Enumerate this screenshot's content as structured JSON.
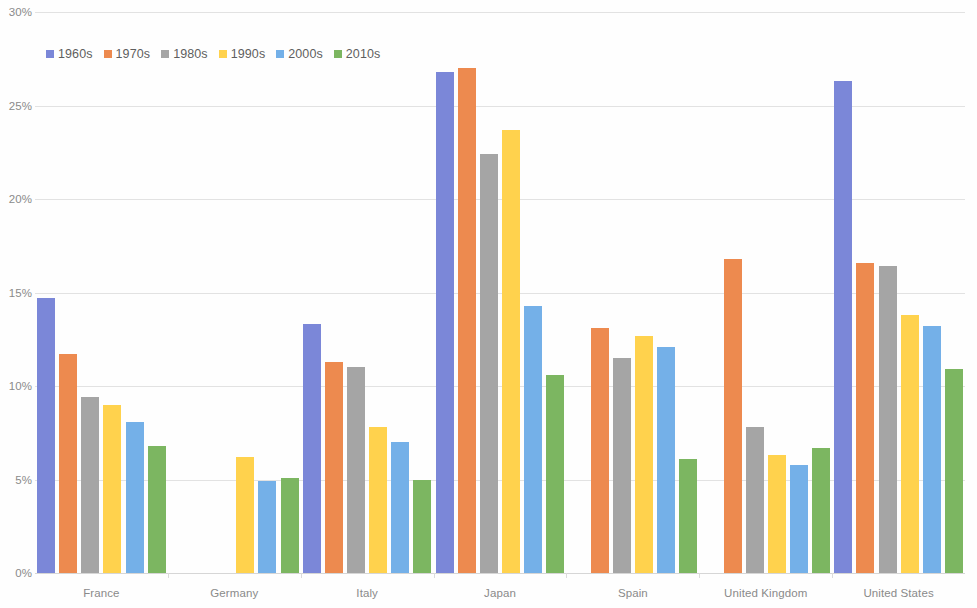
{
  "chart_data": {
    "type": "bar",
    "title": "",
    "subtitle": "",
    "xlabel": "",
    "ylabel": "",
    "ylim": [
      0,
      30
    ],
    "y_ticks": [
      0,
      5,
      10,
      15,
      20,
      25,
      30
    ],
    "y_tick_labels": [
      "0%",
      "5%",
      "10%",
      "15%",
      "20%",
      "25%",
      "30%"
    ],
    "grid": true,
    "legend_position": "top-left",
    "categories": [
      "France",
      "Germany",
      "Italy",
      "Japan",
      "Spain",
      "United Kingdom",
      "United States"
    ],
    "series": [
      {
        "name": "1960s",
        "color": "#7b87d8",
        "values": [
          14.7,
          null,
          13.3,
          26.8,
          null,
          null,
          26.3
        ]
      },
      {
        "name": "1970s",
        "color": "#ed8a4f",
        "values": [
          11.7,
          null,
          11.3,
          27.0,
          13.1,
          16.8,
          16.6
        ]
      },
      {
        "name": "1980s",
        "color": "#a5a5a5",
        "values": [
          9.4,
          null,
          11.0,
          22.4,
          11.5,
          7.8,
          16.4
        ]
      },
      {
        "name": "1990s",
        "color": "#ffd24d",
        "values": [
          9.0,
          6.2,
          7.8,
          23.7,
          12.7,
          6.3,
          13.8
        ]
      },
      {
        "name": "2000s",
        "color": "#74b0e8",
        "values": [
          8.1,
          4.9,
          7.0,
          14.3,
          12.1,
          5.8,
          13.2
        ]
      },
      {
        "name": "2010s",
        "color": "#7cb661",
        "values": [
          6.8,
          5.1,
          5.0,
          10.6,
          6.1,
          6.7,
          10.9
        ]
      }
    ]
  },
  "legend": {
    "items": [
      {
        "label": "1960s",
        "color": "#7b87d8"
      },
      {
        "label": "1970s",
        "color": "#ed8a4f"
      },
      {
        "label": "1980s",
        "color": "#a5a5a5"
      },
      {
        "label": "1990s",
        "color": "#ffd24d"
      },
      {
        "label": "2000s",
        "color": "#74b0e8"
      },
      {
        "label": "2010s",
        "color": "#7cb661"
      }
    ]
  },
  "axes": {
    "y_tick_labels": [
      "30%",
      "25%",
      "20%",
      "15%",
      "10%",
      "5%",
      "0%"
    ],
    "x_tick_labels": [
      "France",
      "Germany",
      "Italy",
      "Japan",
      "Spain",
      "United Kingdom",
      "United States"
    ]
  },
  "colors": {
    "gridline": "#e2e2e2",
    "axis_text": "#8a8a8a",
    "legend_text": "#5e5e5e",
    "background": "#fefefe"
  }
}
